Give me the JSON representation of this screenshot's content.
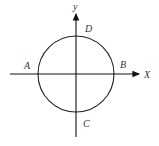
{
  "diagram": {
    "axes": {
      "x_label": "X",
      "y_label": "y"
    },
    "points": {
      "A": "A",
      "B": "B",
      "C": "C",
      "D": "D"
    },
    "colors": {
      "stroke": "#222222",
      "text": "#333333"
    }
  }
}
